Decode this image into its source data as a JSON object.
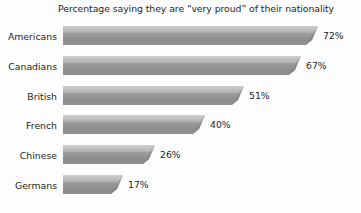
{
  "chart_data": {
    "type": "bar",
    "orientation": "horizontal",
    "title": "Percentage saying they are “very proud” of their nationality",
    "xlabel": "",
    "ylabel": "",
    "xlim": [
      0,
      72
    ],
    "grid": false,
    "legend": null,
    "categories": [
      "Americans",
      "Canadians",
      "British",
      "French",
      "Chinese",
      "Germans"
    ],
    "values": [
      72,
      67,
      51,
      40,
      26,
      17
    ],
    "value_labels": [
      "72%",
      "67%",
      "51%",
      "40%",
      "26%",
      "17%"
    ],
    "bars": [
      {
        "category": "Americans",
        "value": 72,
        "label": "72%"
      },
      {
        "category": "Canadians",
        "value": 67,
        "label": "67%"
      },
      {
        "category": "British",
        "value": 51,
        "label": "51%"
      },
      {
        "category": "French",
        "value": 40,
        "label": "40%"
      },
      {
        "category": "Chinese",
        "value": 26,
        "label": "26%"
      },
      {
        "category": "Germans",
        "value": 17,
        "label": "17%"
      }
    ],
    "colors": {
      "bar_top": "#c0c0c0",
      "bar_body": "#a8a8a8",
      "bar_shadow": "#8e8e8e",
      "bar_bevel": "#7e7e7e",
      "text": "#1d1d1d",
      "background": "#fdfdfd"
    },
    "scale_px_per_unit": 3.545
  }
}
